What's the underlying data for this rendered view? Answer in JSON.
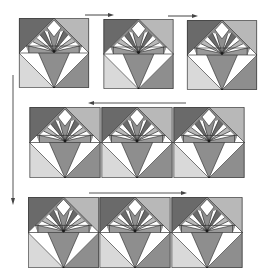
{
  "diagram": {
    "colors": {
      "dark": "#6a6a6a",
      "mid": "#8e8e8e",
      "light": "#b8b8b8",
      "pale": "#d9d9d9",
      "white": "#ffffff",
      "stroke": "#2a2a2a",
      "arrow": "#444444"
    },
    "rows": [
      {
        "name": "row-1",
        "direction": "right",
        "blocks": 3
      },
      {
        "name": "row-2",
        "direction": "left",
        "blocks": 3
      },
      {
        "name": "row-3",
        "direction": "right",
        "blocks": 3
      }
    ],
    "arrows": [
      {
        "name": "row-1-arrow-a",
        "direction": "right"
      },
      {
        "name": "row-1-arrow-b",
        "direction": "right"
      },
      {
        "name": "row-2-arrow",
        "direction": "left"
      },
      {
        "name": "row-3-arrow",
        "direction": "right"
      },
      {
        "name": "vertical-arrow",
        "direction": "down"
      }
    ]
  }
}
